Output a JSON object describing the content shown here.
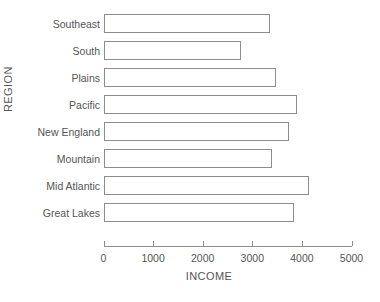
{
  "chart_data": {
    "type": "bar",
    "orientation": "horizontal",
    "title": "",
    "xlabel": "INCOME",
    "ylabel": "REGION",
    "categories": [
      "Southeast",
      "South",
      "Plains",
      "Pacific",
      "New England",
      "Mountain",
      "Mid Atlantic",
      "Great Lakes"
    ],
    "values": [
      3360,
      2780,
      3480,
      3900,
      3740,
      3400,
      4140,
      3840
    ],
    "xlim": [
      0,
      5000
    ],
    "xticks": [
      0,
      1000,
      2000,
      3000,
      4000,
      5000
    ],
    "xtick_labels": [
      "0",
      "1000",
      "2000",
      "3000",
      "4000",
      "5000"
    ],
    "grid": false,
    "legend": false,
    "bar_fill_color": "#ffffff",
    "bar_edge_color": "#8d8d8d",
    "axis_color": "#8d8d8d",
    "text_color": "#555555",
    "background_color": "#ffffff"
  }
}
